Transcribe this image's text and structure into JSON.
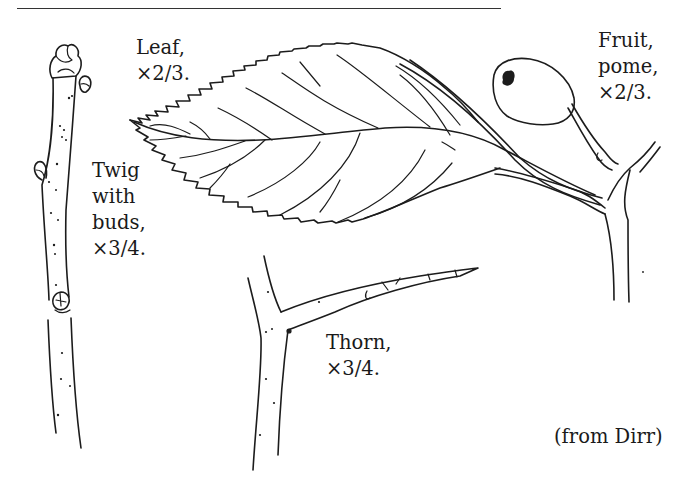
{
  "figure": {
    "top_rule": true,
    "labels": {
      "leaf": {
        "line1": "Leaf,",
        "line2": "×2/3."
      },
      "fruit": {
        "line1": "Fruit,",
        "line2": "pome,",
        "line3": "×2/3."
      },
      "twig": {
        "line1": "Twig",
        "line2": "with",
        "line3": "buds,",
        "line4": "×3/4."
      },
      "thorn": {
        "line1": "Thorn,",
        "line2": "×3/4."
      }
    },
    "credit": "(from Dirr)",
    "drawings": [
      "twig-with-buds",
      "leaf",
      "fruit-pome",
      "thorn"
    ],
    "line_color": "#1c1c1c",
    "background": "#ffffff"
  }
}
